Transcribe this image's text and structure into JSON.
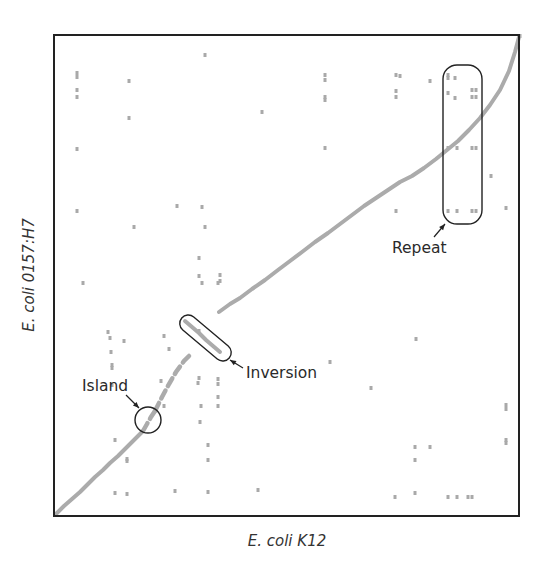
{
  "figure": {
    "type": "dot-plot",
    "x_axis_label": "E. coli K12",
    "y_axis_label": "E. coli 0157:H7",
    "frame": {
      "x": 54,
      "y": 35,
      "width": 465,
      "height": 481
    },
    "colors": {
      "frame": "#222222",
      "alignment": "#ababab",
      "annotation": "#222222"
    }
  },
  "annotations": {
    "island": {
      "label": "Island",
      "label_x": 82,
      "label_y": 391,
      "circle": {
        "cx": 148,
        "cy": 420,
        "r": 13
      },
      "arrow": {
        "x1": 126,
        "y1": 395,
        "x2": 139,
        "y2": 408
      }
    },
    "inversion": {
      "label": "Inversion",
      "label_x": 246,
      "label_y": 378,
      "capsule": {
        "cx": 205.5,
        "cy": 338,
        "length": 62,
        "thickness": 17,
        "angle": 40
      },
      "arrow": {
        "x1": 243,
        "y1": 368,
        "x2": 230,
        "y2": 360
      }
    },
    "repeat": {
      "label": "Repeat",
      "label_x": 392,
      "label_y": 253,
      "box": {
        "x": 443,
        "y": 65,
        "width": 39,
        "height": 159,
        "rx": 14
      },
      "arrow": {
        "x1": 434,
        "y1": 237,
        "x2": 445,
        "y2": 224
      }
    }
  },
  "alignment": {
    "lower_segment": [
      [
        56,
        514
      ],
      [
        64,
        506
      ],
      [
        72,
        499
      ],
      [
        80,
        492
      ],
      [
        88,
        484
      ],
      [
        95,
        477
      ],
      [
        103,
        470
      ],
      [
        110,
        463
      ],
      [
        118,
        456
      ],
      [
        125,
        449
      ],
      [
        132,
        442
      ],
      [
        138,
        436
      ],
      [
        143,
        431
      ]
    ],
    "island_segment": [
      [
        143,
        431
      ],
      [
        147,
        424
      ],
      [
        151,
        417
      ],
      [
        155,
        411
      ]
    ],
    "dashed_segment": [
      [
        155,
        411
      ],
      [
        162,
        397
      ],
      [
        169,
        384
      ],
      [
        176,
        372
      ],
      [
        184,
        361
      ],
      [
        192,
        353
      ]
    ],
    "inversion_segment": [
      [
        185,
        321
      ],
      [
        192,
        327
      ],
      [
        199,
        333
      ],
      [
        206,
        340
      ],
      [
        213,
        346
      ],
      [
        220,
        352
      ]
    ],
    "upper_segment": [
      [
        219,
        312
      ],
      [
        230,
        304
      ],
      [
        240,
        298
      ],
      [
        252,
        289
      ],
      [
        265,
        280
      ],
      [
        278,
        270
      ],
      [
        290,
        261
      ],
      [
        302,
        252
      ],
      [
        315,
        242
      ],
      [
        328,
        233
      ],
      [
        340,
        224
      ],
      [
        352,
        215
      ],
      [
        364,
        206
      ],
      [
        376,
        198
      ],
      [
        388,
        190
      ],
      [
        400,
        182
      ],
      [
        412,
        176
      ],
      [
        424,
        168
      ],
      [
        436,
        159
      ],
      [
        447,
        150
      ],
      [
        458,
        141
      ],
      [
        469,
        130
      ],
      [
        480,
        118
      ],
      [
        490,
        105
      ],
      [
        500,
        90
      ],
      [
        509,
        71
      ],
      [
        515,
        52
      ],
      [
        519,
        37
      ]
    ]
  },
  "scatter_points": [
    [
      205,
      55
    ],
    [
      77,
      73
    ],
    [
      77,
      77
    ],
    [
      129,
      81
    ],
    [
      77,
      90
    ],
    [
      77,
      97
    ],
    [
      129,
      118
    ],
    [
      262,
      112
    ],
    [
      77,
      149
    ],
    [
      77,
      211
    ],
    [
      177,
      206
    ],
    [
      202,
      207
    ],
    [
      134,
      227
    ],
    [
      205,
      227
    ],
    [
      199,
      258
    ],
    [
      199,
      276
    ],
    [
      220,
      275
    ],
    [
      220,
      281
    ],
    [
      202,
      283
    ],
    [
      218,
      283
    ],
    [
      83,
      283
    ],
    [
      325,
      75
    ],
    [
      325,
      80
    ],
    [
      325,
      97
    ],
    [
      325,
      100
    ],
    [
      325,
      148
    ],
    [
      396,
      75
    ],
    [
      400,
      76
    ],
    [
      396,
      91
    ],
    [
      396,
      97
    ],
    [
      430,
      81
    ],
    [
      448,
      75
    ],
    [
      448,
      78
    ],
    [
      455,
      78
    ],
    [
      448,
      93
    ],
    [
      455,
      98
    ],
    [
      472,
      90
    ],
    [
      476,
      90
    ],
    [
      472,
      97
    ],
    [
      476,
      97
    ],
    [
      448,
      148
    ],
    [
      457,
      148
    ],
    [
      472,
      148
    ],
    [
      476,
      148
    ],
    [
      491,
      176
    ],
    [
      448,
      211
    ],
    [
      457,
      211
    ],
    [
      472,
      211
    ],
    [
      476,
      211
    ],
    [
      506,
      208
    ],
    [
      396,
      211
    ],
    [
      520,
      36
    ],
    [
      108,
      332
    ],
    [
      110,
      338
    ],
    [
      124,
      341
    ],
    [
      111,
      352
    ],
    [
      112,
      365
    ],
    [
      112,
      368
    ],
    [
      112,
      385
    ],
    [
      161,
      381
    ],
    [
      169,
      349
    ],
    [
      164,
      336
    ],
    [
      199,
      331
    ],
    [
      199,
      378
    ],
    [
      198,
      383
    ],
    [
      218,
      379
    ],
    [
      218,
      384
    ],
    [
      201,
      406
    ],
    [
      218,
      397
    ],
    [
      218,
      406
    ],
    [
      164,
      406
    ],
    [
      200,
      422
    ],
    [
      115,
      440
    ],
    [
      127,
      459
    ],
    [
      127,
      461
    ],
    [
      208,
      445
    ],
    [
      208,
      460
    ],
    [
      115,
      493
    ],
    [
      127,
      494
    ],
    [
      175,
      491
    ],
    [
      208,
      492
    ],
    [
      258,
      490
    ],
    [
      330,
      362
    ],
    [
      371,
      388
    ],
    [
      416,
      339
    ],
    [
      506,
      405
    ],
    [
      506,
      409
    ],
    [
      506,
      440
    ],
    [
      506,
      443
    ],
    [
      415,
      447
    ],
    [
      430,
      447
    ],
    [
      415,
      460
    ],
    [
      415,
      493
    ],
    [
      395,
      497
    ],
    [
      448,
      497
    ],
    [
      457,
      497
    ],
    [
      468,
      497
    ],
    [
      472,
      497
    ]
  ]
}
